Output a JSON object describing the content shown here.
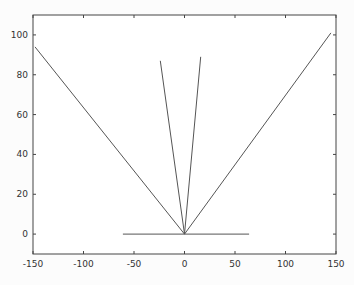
{
  "chart_data": {
    "type": "line",
    "title": "",
    "xlabel": "",
    "ylabel": "",
    "xlim": [
      -150,
      150
    ],
    "ylim": [
      -10,
      110
    ],
    "grid": false,
    "legend": null,
    "xticks": [
      -150,
      -100,
      -50,
      0,
      50,
      100,
      150
    ],
    "yticks": [
      0,
      20,
      40,
      60,
      80,
      100
    ],
    "line_color": "#555555",
    "series": [
      {
        "name": "left-wide",
        "x": [
          0,
          -148
        ],
        "y": [
          0,
          94
        ]
      },
      {
        "name": "left-steep",
        "x": [
          0,
          -24
        ],
        "y": [
          0,
          87
        ]
      },
      {
        "name": "right-steep",
        "x": [
          0,
          16
        ],
        "y": [
          0,
          89
        ]
      },
      {
        "name": "right-wide",
        "x": [
          0,
          145
        ],
        "y": [
          0,
          101
        ]
      },
      {
        "name": "baseline",
        "x": [
          -61,
          64
        ],
        "y": [
          0,
          0
        ]
      }
    ]
  }
}
